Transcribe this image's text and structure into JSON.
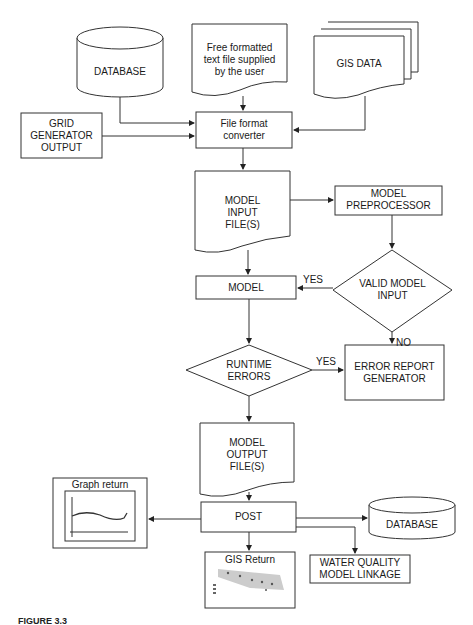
{
  "diagram": {
    "nodes": {
      "database_top": {
        "label": "DATABASE",
        "shape": "cylinder"
      },
      "free_text": {
        "lines": [
          "Free formatted",
          "text file supplied",
          "by the user"
        ],
        "shape": "document"
      },
      "gis_data": {
        "label": "GIS DATA",
        "shape": "multi-document"
      },
      "grid_generator": {
        "lines": [
          "GRID",
          "GENERATOR",
          "OUTPUT"
        ],
        "shape": "rectangle"
      },
      "file_converter": {
        "lines": [
          "File format",
          "converter"
        ],
        "shape": "rectangle"
      },
      "model_input": {
        "lines": [
          "MODEL",
          "INPUT",
          "FILE(S)"
        ],
        "shape": "document"
      },
      "preprocessor": {
        "lines": [
          "MODEL",
          "PREPROCESSOR"
        ],
        "shape": "rectangle"
      },
      "valid_input": {
        "lines": [
          "VALID MODEL",
          "INPUT"
        ],
        "shape": "diamond"
      },
      "model": {
        "label": "MODEL",
        "shape": "rectangle"
      },
      "runtime_errors": {
        "lines": [
          "RUNTIME",
          "ERRORS"
        ],
        "shape": "diamond"
      },
      "error_report": {
        "lines": [
          "ERROR REPORT",
          "GENERATOR"
        ],
        "shape": "rectangle"
      },
      "model_output": {
        "lines": [
          "MODEL",
          "OUTPUT",
          "FILE(S)"
        ],
        "shape": "document"
      },
      "post": {
        "label": "POST",
        "shape": "rectangle"
      },
      "graph_return": {
        "label": "Graph return",
        "shape": "rectangle-with-graph"
      },
      "database_bottom": {
        "label": "DATABASE",
        "shape": "cylinder"
      },
      "water_quality": {
        "lines": [
          "WATER QUALITY",
          "MODEL LINKAGE"
        ],
        "shape": "rectangle"
      },
      "gis_return": {
        "label": "GIS Return",
        "shape": "rectangle-with-map"
      }
    },
    "edge_labels": {
      "valid_yes": "YES",
      "valid_no": "NO",
      "runtime_yes": "YES"
    },
    "edges": [
      [
        "database_top",
        "file_converter"
      ],
      [
        "free_text",
        "file_converter"
      ],
      [
        "gis_data",
        "file_converter"
      ],
      [
        "grid_generator",
        "file_converter"
      ],
      [
        "file_converter",
        "model_input"
      ],
      [
        "model_input",
        "preprocessor"
      ],
      [
        "model_input",
        "model"
      ],
      [
        "preprocessor",
        "valid_input"
      ],
      [
        "valid_input",
        "model",
        "YES"
      ],
      [
        "valid_input",
        "error_report",
        "NO"
      ],
      [
        "model",
        "runtime_errors"
      ],
      [
        "runtime_errors",
        "error_report",
        "YES"
      ],
      [
        "runtime_errors",
        "model_output"
      ],
      [
        "model_output",
        "post"
      ],
      [
        "post",
        "graph_return"
      ],
      [
        "post",
        "database_bottom"
      ],
      [
        "post",
        "water_quality"
      ],
      [
        "post",
        "gis_return"
      ]
    ]
  },
  "caption": "FIGURE 3.3"
}
